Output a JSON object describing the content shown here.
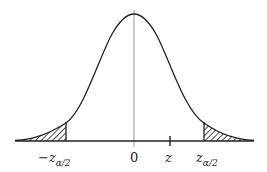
{
  "diagram": {
    "type": "standard normal distribution curve with two-tailed rejection regions",
    "labels": {
      "neg_critical": "−z",
      "neg_critical_sub": "α/2",
      "zero": "0",
      "z": "z",
      "pos_critical": "z",
      "pos_critical_sub": "α/2"
    },
    "colors": {
      "curve": "#222222",
      "axis": "#222222",
      "center_line": "#999999",
      "hatch": "#222222"
    },
    "shaded_regions": [
      "left tail (x < −zα/2)",
      "right tail (x > zα/2)"
    ]
  }
}
